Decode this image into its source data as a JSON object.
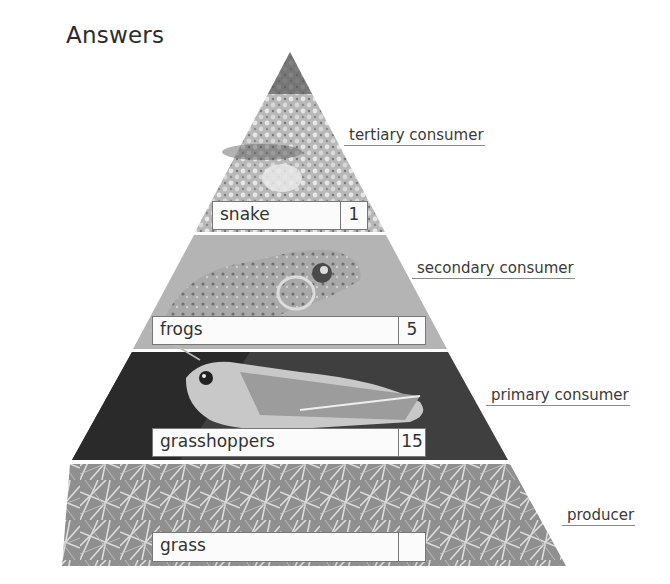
{
  "title": "Answers",
  "tiers": [
    {
      "organism": "snake",
      "count": "1",
      "role": "tertiary consumer",
      "image": "snake-photo"
    },
    {
      "organism": "frogs",
      "count": "5",
      "role": "secondary consumer",
      "image": "frog-photo"
    },
    {
      "organism": "grasshoppers",
      "count": "15",
      "role": "primary consumer",
      "image": "grasshopper-photo"
    },
    {
      "organism": "grass",
      "count": "",
      "role": "producer",
      "image": "grass-photo"
    }
  ],
  "colors": {
    "label_text": "#3a3a3a",
    "box_border": "#777777",
    "box_fill": "#fbfbfb"
  }
}
